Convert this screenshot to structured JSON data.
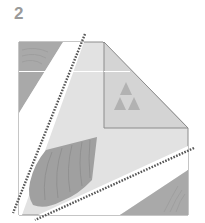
{
  "step": {
    "number": "2"
  },
  "diagram": {
    "type": "origami-fold-step",
    "colors": {
      "paper_light": "#e4e4e4",
      "paper_mid": "#d2d2d2",
      "paper_dark": "#a8a8a8",
      "fold_line": "#5a5a5a",
      "edge": "#8c8c8c",
      "white_band": "#ffffff",
      "shell": "#9d9d9d",
      "triforce": "#b0b0b0"
    },
    "elements": [
      "outer-paper-shape",
      "folded-corner-panel",
      "triforce-emblem",
      "shell-pattern",
      "top-left-dark-triangle",
      "bottom-right-dark-triangle",
      "valley-fold-line-left",
      "valley-fold-line-bottom"
    ]
  }
}
